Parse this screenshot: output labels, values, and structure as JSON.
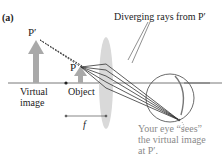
{
  "panel_label": "(a)",
  "labels": {
    "p_prime": "P′",
    "p": "P",
    "virtual_image_line1": "Virtual",
    "virtual_image_line2": "image",
    "object": "Object",
    "focal_length": "f",
    "diverging_rays": "Diverging rays from P′",
    "eye_caption_line1": "Your eye “sees”",
    "eye_caption_line2": "the virtual image",
    "eye_caption_line3": "at P′."
  },
  "colors": {
    "arrow_fill": "#a9a9a9",
    "lens_fill": "#d9d9d9",
    "ray": "#333333",
    "axis": "#555555",
    "caption": "#8a8a8a"
  }
}
